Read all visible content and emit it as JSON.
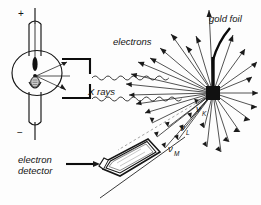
{
  "figure": {
    "width": 261,
    "height": 205,
    "background_color": "#fdfdfd",
    "ink_color": "#161616"
  },
  "labels": {
    "plus_terminal": "+",
    "minus_terminal": "−",
    "x_rays": "X rays",
    "electrons": "electrons",
    "gold_foil": "gold foil",
    "electron_detector_line1": "electron",
    "electron_detector_line2": "detector",
    "nu_symbol": "ν",
    "shell_k": "K",
    "shell_l": "L",
    "shell_m": "M"
  },
  "components": {
    "xray_tube": "x-ray-tube",
    "anode": "anode",
    "cathode_filament": "cathode-filament",
    "collimator": "collimator",
    "xray_beam": "wavy-x-ray-beam",
    "foil": "gold-foil-target",
    "scatter_center": "interaction-point",
    "detector": "electron-detector-housing",
    "pointer_line": "label-leader-line"
  },
  "electron_rays": {
    "count": 32,
    "description": "photoelectrons emitted radially from the foil interaction point",
    "origin": {
      "x": 213,
      "y": 93
    }
  },
  "shell_labels": [
    {
      "name": "nu_K",
      "symbol": "ν",
      "subscript": "K",
      "x": 196,
      "y": 112
    },
    {
      "name": "nu_L",
      "symbol": "ν",
      "subscript": "L",
      "x": 181,
      "y": 131
    },
    {
      "name": "nu_M",
      "symbol": "ν",
      "subscript": "M",
      "x": 170,
      "y": 152
    }
  ]
}
